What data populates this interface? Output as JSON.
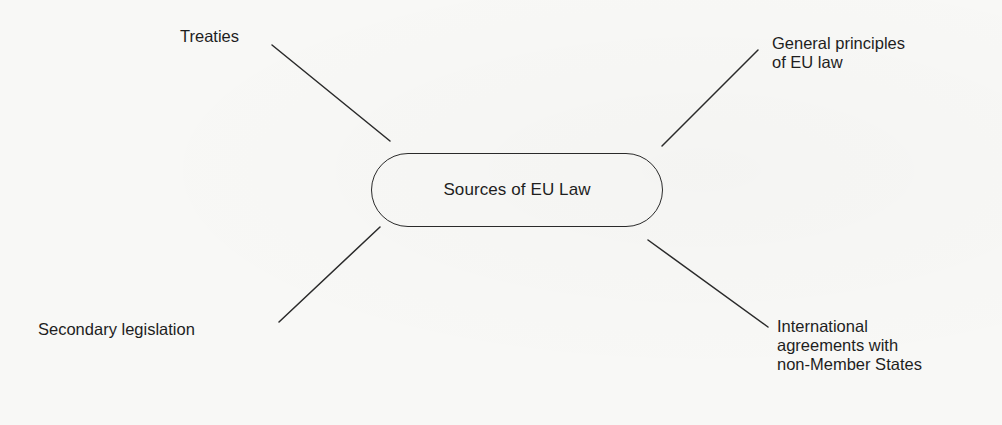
{
  "diagram": {
    "type": "mind-map",
    "center": {
      "label": "Sources of EU Law"
    },
    "nodes": [
      {
        "id": "treaties",
        "position": "top-left",
        "lines": [
          "Treaties"
        ]
      },
      {
        "id": "general-principles",
        "position": "top-right",
        "lines": [
          "General principles",
          "of EU law"
        ]
      },
      {
        "id": "secondary-legislation",
        "position": "bottom-left",
        "lines": [
          "Secondary legislation"
        ]
      },
      {
        "id": "international-agreements",
        "position": "bottom-right",
        "lines": [
          "International",
          "agreements with",
          "non-Member States"
        ]
      }
    ],
    "edges": [
      {
        "from": "center",
        "to": "treaties"
      },
      {
        "from": "center",
        "to": "general-principles"
      },
      {
        "from": "center",
        "to": "secondary-legislation"
      },
      {
        "from": "center",
        "to": "international-agreements"
      }
    ],
    "colors": {
      "ink": "#1e1e1e",
      "line": "#2a2a2a",
      "paper": "#f8f8f6"
    }
  }
}
